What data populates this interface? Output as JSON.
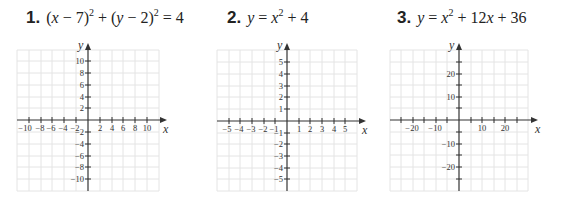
{
  "problems": [
    {
      "number": "1.",
      "equation_parts": [
        "(",
        "x",
        " − 7)",
        "2",
        " + (",
        "y",
        " − 2)",
        "2",
        " = 4"
      ],
      "equation": "(x − 7)^2 + (y − 2)^2 = 4",
      "graph": {
        "x_axis_label": "x",
        "y_axis_label": "y",
        "x_ticks": [
          "−10",
          "−8",
          "−6",
          "−4",
          "−2",
          "2",
          "4",
          "6",
          "8",
          "10"
        ],
        "y_ticks": [
          "10",
          "8",
          "6",
          "4",
          "2",
          "−2",
          "−4",
          "−6",
          "−8",
          "−10"
        ],
        "tick_step": 2,
        "range": [
          -12,
          12
        ]
      }
    },
    {
      "number": "2.",
      "equation_parts": [
        "y",
        " = ",
        "x",
        "2",
        " + 4"
      ],
      "equation": "y = x^2 + 4",
      "graph": {
        "x_axis_label": "x",
        "y_axis_label": "y",
        "x_ticks": [
          "−5",
          "−4",
          "−3",
          "−2",
          "−1",
          "1",
          "2",
          "3",
          "4",
          "5"
        ],
        "y_ticks": [
          "5",
          "4",
          "3",
          "2",
          "1",
          "−1",
          "−2",
          "−3",
          "−4",
          "−5"
        ],
        "tick_step": 1,
        "range": [
          -6,
          6
        ]
      }
    },
    {
      "number": "3.",
      "equation_parts": [
        "y",
        " = ",
        "x",
        "2",
        " + 12",
        "x",
        " + 36"
      ],
      "equation": "y = x^2 + 12x + 36",
      "graph": {
        "x_axis_label": "x",
        "y_axis_label": "y",
        "x_ticks": [
          "−20",
          "−10",
          "10",
          "20"
        ],
        "y_ticks": [
          "20",
          "10",
          "−10",
          "−20"
        ],
        "tick_step": 5,
        "range": [
          -30,
          30
        ]
      }
    }
  ]
}
